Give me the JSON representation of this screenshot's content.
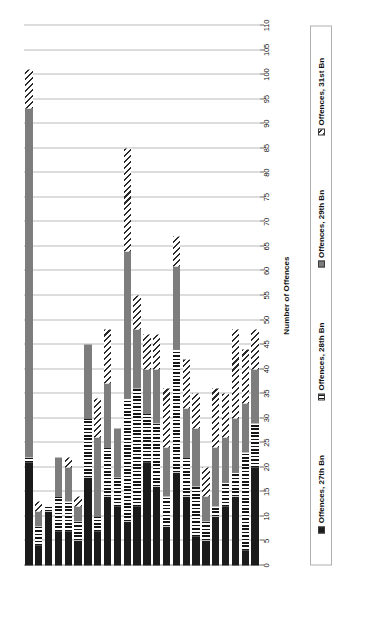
{
  "chart_data": {
    "type": "bar",
    "orientation": "horizontal-stacked-rotated",
    "title": "",
    "xlabel": "",
    "ylabel": "Number of Offences",
    "ylim": [
      0,
      110
    ],
    "ytick_step": 5,
    "yticks": [
      0,
      5,
      10,
      15,
      20,
      25,
      30,
      35,
      40,
      45,
      50,
      55,
      60,
      65,
      70,
      75,
      80,
      85,
      90,
      95,
      100,
      105,
      110
    ],
    "grid": true,
    "legend_position": "bottom",
    "stacked": true,
    "categories": [
      "Jan. 1917",
      "Feb. 1917",
      "Mar. 1917",
      "Apr. 1917",
      "May. 1917",
      "June. 1917",
      "July. 1917",
      "Aug. 1917",
      "Sept. 1917",
      "Oct. 1917",
      "Nov. 1917",
      "Dec. 1917",
      "Jan. 1918",
      "Feb. 1918",
      "Mar. 1918",
      "Apr. 1918",
      "May. 1918",
      "June. 1918",
      "July. 1918",
      "Aug. 1918",
      "Sept. 1918",
      "Oct. 1918",
      "Nov. 1918",
      "Dec. 1918"
    ],
    "series": [
      {
        "name": "Offences, 27th Bn",
        "key": "s-27",
        "fill": "solid-black",
        "color": "#1b1b1b",
        "values": [
          20,
          3,
          14,
          12,
          10,
          5,
          6,
          14,
          19,
          8,
          16,
          21,
          12,
          9,
          12,
          14,
          7,
          18,
          5,
          7,
          7,
          11,
          4,
          21
        ]
      },
      {
        "name": "Offences, 28th Bn",
        "key": "s-28",
        "fill": "vertical-stripes",
        "color": "#151515",
        "values": [
          9,
          20,
          5,
          5,
          2,
          4,
          10,
          8,
          25,
          6,
          13,
          10,
          24,
          25,
          6,
          10,
          3,
          12,
          4,
          6,
          7,
          1,
          4,
          1
        ]
      },
      {
        "name": "Offences, 29th Bn",
        "key": "s-29",
        "fill": "solid-gray",
        "color": "#7d7d7d",
        "values": [
          11,
          10,
          11,
          9,
          12,
          5,
          12,
          10,
          17,
          10,
          11,
          9,
          12,
          30,
          10,
          13,
          16,
          15,
          3,
          7,
          8,
          0,
          3,
          71
        ]
      },
      {
        "name": "Offences, 31st Bn",
        "key": "s-31",
        "fill": "diagonal-hatch",
        "color": "#2b2b2b",
        "values": [
          8,
          11,
          18,
          9,
          12,
          6,
          7,
          10,
          6,
          12,
          7,
          7,
          7,
          21,
          0,
          11,
          8,
          0,
          2,
          2,
          0,
          0,
          2,
          8
        ]
      }
    ],
    "totals": [
      48,
      44,
      48,
      35,
      36,
      20,
      35,
      42,
      67,
      36,
      47,
      47,
      55,
      85,
      28,
      48,
      34,
      45,
      14,
      22,
      22,
      12,
      13,
      101
    ]
  },
  "legend": {
    "items": [
      {
        "label": "Offences, 27th Bn",
        "swatch": "s-27"
      },
      {
        "label": "Offences, 28th Bn",
        "swatch": "s-28"
      },
      {
        "label": "Offences, 29th Bn",
        "swatch": "s-29"
      },
      {
        "label": "Offences, 31st Bn",
        "swatch": "s-31"
      }
    ]
  }
}
